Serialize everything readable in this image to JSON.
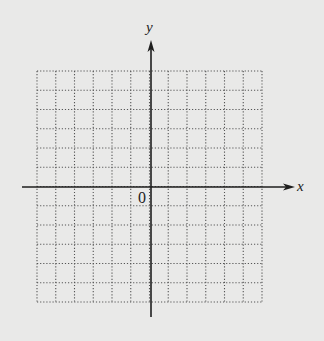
{
  "diagram": {
    "type": "coordinate-grid",
    "background": "#e9e9e8",
    "grid": {
      "left": 37,
      "top": 71,
      "right": 262,
      "bottom": 302,
      "columns": 12,
      "rows": 12,
      "line_color": "#555555",
      "line_style": "dotted"
    },
    "origin": {
      "x": 151,
      "y": 187
    },
    "x_axis": {
      "start_x": 22,
      "end_x": 295,
      "label": "x"
    },
    "y_axis": {
      "start_y": 40,
      "end_y": 317,
      "label": "y"
    },
    "origin_label": "0",
    "axis_color": "#1e1e1e"
  }
}
